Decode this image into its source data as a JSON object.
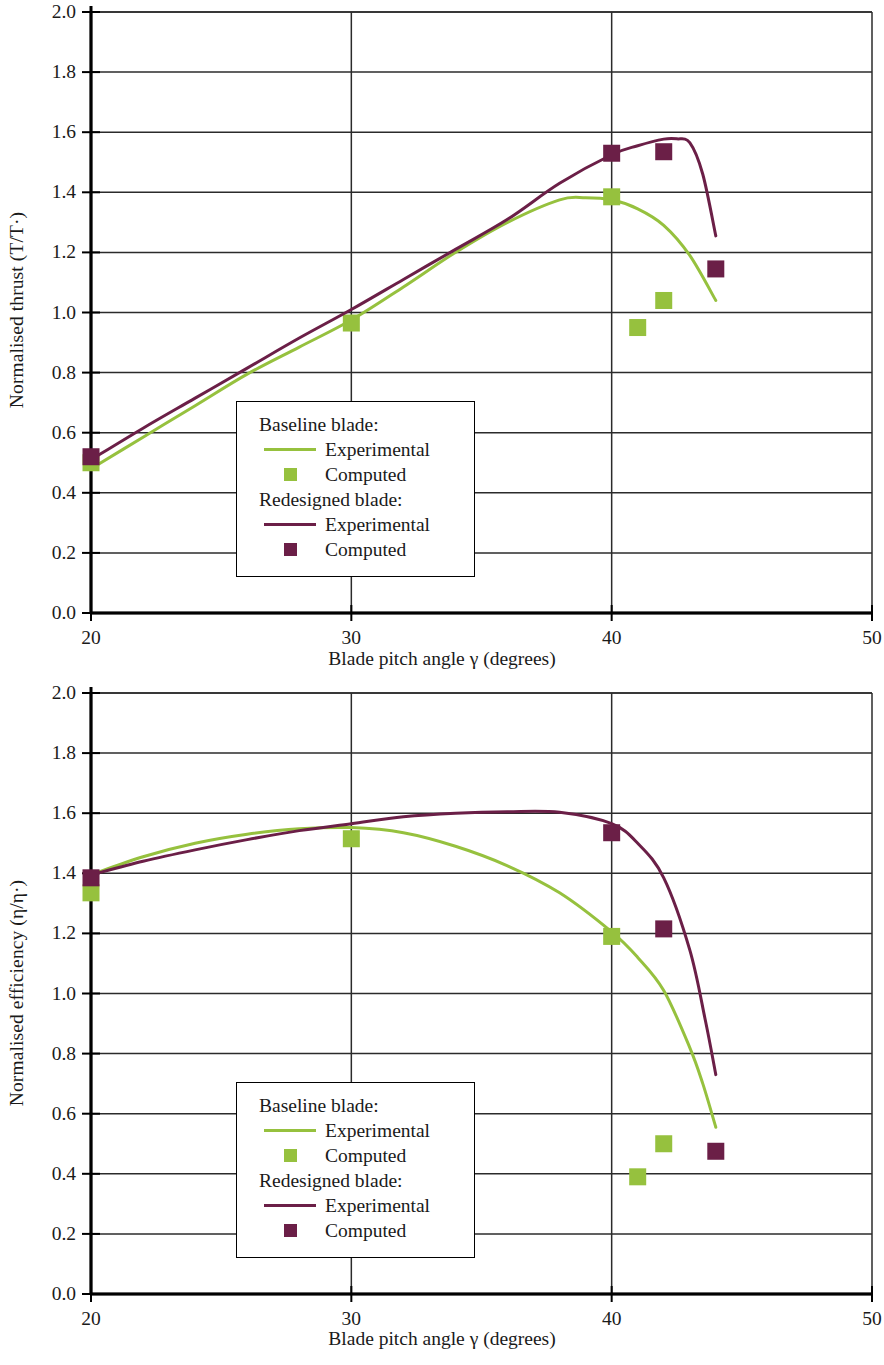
{
  "colors": {
    "baseline": "#96c13e",
    "redesigned": "#6b1f47",
    "axis": "#000000",
    "grid": "#2b2b2b",
    "background": "#ffffff"
  },
  "legend": {
    "baseline_title": "Baseline blade:",
    "baseline_experimental": "Experimental",
    "baseline_computed": "Computed",
    "redesigned_title": "Redesigned blade:",
    "redesigned_experimental": "Experimental",
    "redesigned_computed": "Computed"
  },
  "axis_labels": {
    "x": "Blade pitch angle γ (degrees)",
    "y_thrust": "Normalised thrust (T/T·)",
    "y_efficiency": "Normalised efficiency (η/η·)"
  },
  "ticks": {
    "y": [
      "0.0",
      "0.2",
      "0.4",
      "0.6",
      "0.8",
      "1.0",
      "1.2",
      "1.4",
      "1.6",
      "1.8",
      "2.0"
    ],
    "x": [
      "20",
      "30",
      "40",
      "50"
    ]
  },
  "chart_data": [
    {
      "type": "line",
      "title": "",
      "xlabel": "Blade pitch angle γ (degrees)",
      "ylabel": "Normalised thrust (T/T*)",
      "xlim": [
        20,
        50
      ],
      "ylim": [
        0.0,
        2.0
      ],
      "xticks": [
        20,
        30,
        40,
        50
      ],
      "yticks": [
        0.0,
        0.2,
        0.4,
        0.6,
        0.8,
        1.0,
        1.2,
        1.4,
        1.6,
        1.8,
        2.0
      ],
      "grid": true,
      "legend_position": "inside-center-lower-left",
      "series": [
        {
          "name": "Baseline blade: Experimental",
          "kind": "line",
          "color": "#96c13e",
          "x": [
            20.0,
            22.0,
            24.0,
            26.0,
            28.0,
            30.0,
            32.0,
            34.0,
            36.0,
            38.0,
            39.0,
            40.0,
            41.0,
            42.0,
            43.0,
            44.0
          ],
          "y": [
            0.48,
            0.585,
            0.69,
            0.795,
            0.885,
            0.975,
            1.085,
            1.2,
            1.3,
            1.375,
            1.382,
            1.375,
            1.345,
            1.29,
            1.19,
            1.04
          ]
        },
        {
          "name": "Baseline blade: Computed",
          "kind": "scatter",
          "color": "#96c13e",
          "x": [
            20.0,
            30.0,
            40.0,
            42.0,
            41.0
          ],
          "y": [
            0.5,
            0.965,
            1.385,
            1.04,
            0.95
          ]
        },
        {
          "name": "Redesigned blade: Experimental",
          "kind": "line",
          "color": "#6b1f47",
          "x": [
            20.0,
            22.0,
            24.0,
            26.0,
            28.0,
            30.0,
            32.0,
            34.0,
            36.0,
            38.0,
            40.0,
            41.0,
            42.0,
            42.5,
            43.0,
            43.5,
            44.0
          ],
          "y": [
            0.51,
            0.615,
            0.715,
            0.815,
            0.915,
            1.01,
            1.11,
            1.21,
            1.31,
            1.43,
            1.525,
            1.555,
            1.577,
            1.578,
            1.565,
            1.46,
            1.255
          ]
        },
        {
          "name": "Redesigned blade: Computed",
          "kind": "scatter",
          "color": "#6b1f47",
          "x": [
            20.0,
            40.0,
            42.0,
            44.0
          ],
          "y": [
            0.52,
            1.53,
            1.535,
            1.145
          ]
        }
      ]
    },
    {
      "type": "line",
      "title": "",
      "xlabel": "Blade pitch angle γ (degrees)",
      "ylabel": "Normalised efficiency (η/η*)",
      "xlim": [
        20,
        50
      ],
      "ylim": [
        0.0,
        2.0
      ],
      "xticks": [
        20,
        30,
        40,
        50
      ],
      "yticks": [
        0.0,
        0.2,
        0.4,
        0.6,
        0.8,
        1.0,
        1.2,
        1.4,
        1.6,
        1.8,
        2.0
      ],
      "grid": true,
      "legend_position": "inside-center-lower-left",
      "series": [
        {
          "name": "Baseline blade: Experimental",
          "kind": "line",
          "color": "#96c13e",
          "x": [
            20.0,
            22.0,
            24.0,
            26.0,
            28.0,
            30.0,
            32.0,
            34.0,
            36.0,
            38.0,
            40.0,
            41.0,
            42.0,
            43.0,
            43.5,
            44.0
          ],
          "y": [
            1.395,
            1.455,
            1.5,
            1.53,
            1.548,
            1.552,
            1.535,
            1.49,
            1.425,
            1.335,
            1.205,
            1.12,
            1.01,
            0.82,
            0.7,
            0.555
          ]
        },
        {
          "name": "Baseline blade: Computed",
          "kind": "scatter",
          "color": "#96c13e",
          "x": [
            20.0,
            30.0,
            40.0,
            42.0,
            41.0
          ],
          "y": [
            1.335,
            1.515,
            1.19,
            0.5,
            0.39
          ]
        },
        {
          "name": "Redesigned blade: Experimental",
          "kind": "line",
          "color": "#6b1f47",
          "x": [
            20.0,
            22.0,
            24.0,
            26.0,
            28.0,
            30.0,
            32.0,
            34.0,
            36.0,
            38.0,
            40.0,
            41.0,
            42.0,
            43.0,
            43.6,
            44.0
          ],
          "y": [
            1.395,
            1.44,
            1.478,
            1.512,
            1.542,
            1.565,
            1.588,
            1.6,
            1.605,
            1.603,
            1.565,
            1.5,
            1.385,
            1.145,
            0.91,
            0.73
          ]
        },
        {
          "name": "Redesigned blade: Computed",
          "kind": "scatter",
          "color": "#6b1f47",
          "x": [
            20.0,
            40.0,
            42.0,
            44.0
          ],
          "y": [
            1.385,
            1.535,
            1.215,
            0.475
          ]
        }
      ]
    }
  ]
}
